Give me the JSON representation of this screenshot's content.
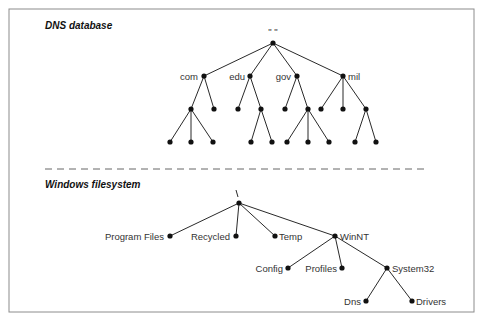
{
  "sections": {
    "dns": {
      "title": "DNS database",
      "root_label": "\" \"",
      "labels": {
        "com": "com",
        "edu": "edu",
        "gov": "gov",
        "mil": "mil"
      }
    },
    "fs": {
      "title": "Windows filesystem",
      "root_label": "\\",
      "labels": {
        "program_files": "Program Files",
        "recycled": "Recycled",
        "temp": "Temp",
        "winnt": "WinNT",
        "config": "Config",
        "profiles": "Profiles",
        "system32": "System32",
        "dns": "Dns",
        "drivers": "Drivers"
      }
    }
  },
  "colors": {
    "ink": "#111111",
    "border": "#8c8c8c",
    "divider": "#555555"
  }
}
